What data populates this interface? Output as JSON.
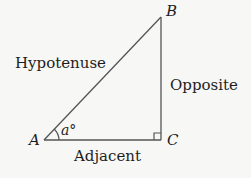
{
  "diagram": {
    "type": "right-triangle",
    "vertices": {
      "A": {
        "label": "A"
      },
      "B": {
        "label": "B"
      },
      "C": {
        "label": "C"
      }
    },
    "sides": {
      "hypotenuse": {
        "label": "Hypotenuse"
      },
      "opposite": {
        "label": "Opposite"
      },
      "adjacent": {
        "label": "Adjacent"
      }
    },
    "angle": {
      "label": "a°"
    },
    "right_angle_marker": {
      "vertex": "C"
    },
    "colors": {
      "line": "#555555",
      "text": "#1e1e1e",
      "background": "#f7f7f5"
    }
  }
}
